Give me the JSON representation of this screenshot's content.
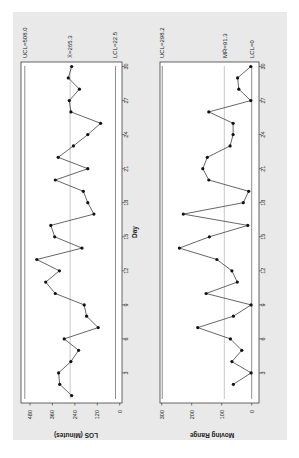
{
  "figure": {
    "background": "#e9e9e9",
    "plot_background": "#ffffff",
    "line_color": "#404040",
    "center_line_color": "#a0a0a0",
    "limit_line_color": "#707070",
    "rotation_deg": -90
  },
  "chart_data": [
    {
      "type": "line",
      "title": "",
      "subtitle": "I chart of LOS",
      "xlabel": "Day",
      "ylabel": "LOS (Minutes)",
      "x_ticks": [
        3,
        6,
        9,
        12,
        15,
        18,
        21,
        24,
        27,
        30
      ],
      "y_ticks": [
        0,
        120,
        240,
        360,
        480
      ],
      "ylim": [
        0,
        480
      ],
      "xlim": [
        0,
        31
      ],
      "grid": false,
      "x": [
        1,
        2,
        3,
        4,
        5,
        6,
        7,
        8,
        9,
        10,
        11,
        12,
        13,
        14,
        15,
        16,
        17,
        18,
        19,
        20,
        21,
        22,
        23,
        24,
        25,
        26,
        27,
        28,
        29,
        30
      ],
      "series": [
        {
          "name": "LOS",
          "values": [
            257,
            321,
            327,
            261,
            220,
            297,
            115,
            177,
            190,
            345,
            396,
            323,
            444,
            202,
            348,
            369,
            138,
            171,
            195,
            345,
            171,
            329,
            248,
            171,
            102,
            261,
            270,
            216,
            275,
            257
          ]
        }
      ],
      "control_limits": {
        "UCL": 508.0,
        "center": 265.3,
        "LCL": 22.5
      },
      "annotations": [
        "UCL=508.0",
        "X̄=265.3",
        "LCL=22.5"
      ]
    },
    {
      "type": "line",
      "title": "",
      "subtitle": "Moving Range chart",
      "xlabel": "Day",
      "ylabel": "Moving Range",
      "x_ticks": [
        3,
        6,
        9,
        12,
        15,
        18,
        21,
        24,
        27,
        30
      ],
      "y_ticks": [
        0,
        100,
        200,
        300
      ],
      "ylim": [
        0,
        300
      ],
      "xlim": [
        0,
        31
      ],
      "grid": false,
      "x": [
        2,
        3,
        4,
        5,
        6,
        7,
        8,
        9,
        10,
        11,
        12,
        13,
        14,
        15,
        16,
        17,
        18,
        19,
        20,
        21,
        22,
        23,
        24,
        25,
        26,
        27,
        28,
        29,
        30
      ],
      "series": [
        {
          "name": "Moving Range",
          "values": [
            61,
            2,
            66,
            33,
            71,
            180,
            61,
            2,
            152,
            48,
            66,
            116,
            241,
            141,
            13,
            228,
            28,
            10,
            143,
            163,
            148,
            72,
            62,
            62,
            143,
            3,
            43,
            47,
            3
          ]
        }
      ],
      "control_limits": {
        "UCL": 298.2,
        "center": 91.3,
        "LCL": 0
      },
      "annotations": [
        "UCL=298.2",
        "MR̄=91.3",
        "LCL=0"
      ]
    }
  ],
  "labels": {
    "los_ucl": "UCL=508.0",
    "los_center": "X̄=265.3",
    "los_lcl": "LCL=22.5",
    "mr_ucl": "UCL=298.2",
    "mr_center": "MR̄=91.3",
    "mr_lcl": "LCL=0",
    "los_ylabel": "LOS (Minutes)",
    "mr_ylabel": "Moving Range",
    "xlabel": "Day"
  }
}
